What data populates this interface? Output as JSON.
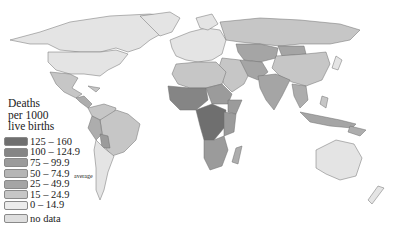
{
  "map": {
    "title_lines": [
      "Deaths",
      "per 1000",
      "live births"
    ],
    "legend": [
      {
        "label": "125 – 160",
        "color": "#6f6f6f"
      },
      {
        "label": "100 – 124.9",
        "color": "#858585"
      },
      {
        "label": "75 – 99.9",
        "color": "#9b9b9b"
      },
      {
        "label": "50 – 74.9",
        "color": "#adadad",
        "annotation": "average"
      },
      {
        "label": "25 – 49.9",
        "color": "#a5a5a5"
      },
      {
        "label": "15 – 24.9",
        "color": "#c6c6c6"
      },
      {
        "label": "0 – 14.9",
        "color": "#e4e4e4"
      },
      {
        "label": "no data",
        "color": "#dedede"
      }
    ],
    "colors": {
      "ocean": "#ffffff",
      "border": "#6f6f6f"
    }
  }
}
